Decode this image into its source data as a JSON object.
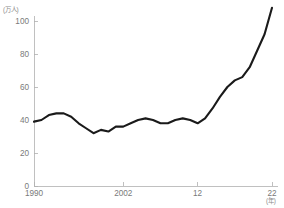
{
  "chart_data": {
    "type": "line",
    "title": "",
    "xlabel": "(年)",
    "ylabel": "(万人)",
    "y_unit_label": "(万人)",
    "x_unit_label": "(年)",
    "xlim": [
      1990,
      2022
    ],
    "ylim": [
      0,
      112
    ],
    "grid": false,
    "legend": null,
    "y_ticks": [
      0,
      20,
      40,
      60,
      80,
      100
    ],
    "y_tick_labels": [
      "0",
      "20",
      "40",
      "60",
      "80",
      "100"
    ],
    "x_ticks": [
      1990,
      2002,
      2012,
      2022
    ],
    "x_tick_labels": [
      "1990",
      "2002",
      "12",
      "22"
    ],
    "series": [
      {
        "name": "人数",
        "color": "#1a1a1a",
        "x": [
          1990,
          1991,
          1992,
          1993,
          1994,
          1995,
          1996,
          1997,
          1998,
          1999,
          2000,
          2001,
          2002,
          2003,
          2004,
          2005,
          2006,
          2007,
          2008,
          2009,
          2010,
          2011,
          2012,
          2013,
          2014,
          2015,
          2016,
          2017,
          2018,
          2019,
          2020,
          2021,
          2022
        ],
        "values": [
          39,
          40,
          43,
          44,
          44,
          42,
          38,
          35,
          32,
          34,
          33,
          36,
          36,
          38,
          40,
          41,
          40,
          38,
          38,
          40,
          41,
          40,
          38,
          41,
          47,
          54,
          60,
          64,
          66,
          72,
          82,
          92,
          108
        ]
      }
    ]
  }
}
